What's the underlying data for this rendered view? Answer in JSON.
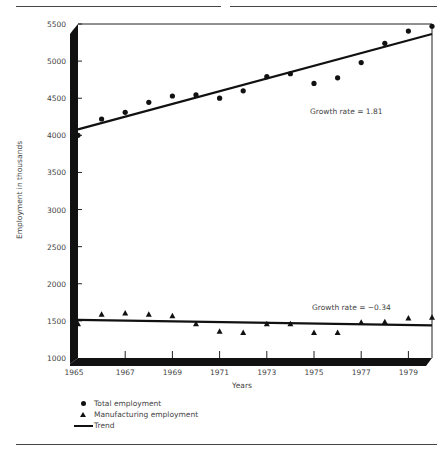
{
  "chart_data": {
    "type": "scatter",
    "title": "",
    "xlabel": "Years",
    "ylabel": "Employment in thousands",
    "ylim": [
      1000,
      5500
    ],
    "xlim": [
      1965,
      1980
    ],
    "grid": false,
    "legend_position": "below-left",
    "x_ticks": [
      "1965",
      "1967",
      "1969",
      "1971",
      "1973",
      "1975",
      "1977",
      "1979"
    ],
    "y_ticks": [
      "1000",
      "1500",
      "2000",
      "2500",
      "3000",
      "3500",
      "4000",
      "4500",
      "5000",
      "5500"
    ],
    "x": [
      1965,
      1966,
      1967,
      1968,
      1969,
      1970,
      1971,
      1972,
      1973,
      1974,
      1975,
      1976,
      1977,
      1978,
      1979,
      1980
    ],
    "series": [
      {
        "name": "Total employment",
        "marker": "circle",
        "values": [
          4000,
          4220,
          4310,
          4445,
          4530,
          4545,
          4500,
          4600,
          4790,
          4830,
          4700,
          4775,
          4980,
          5240,
          5405,
          5470
        ]
      },
      {
        "name": "Manufacturing employment",
        "marker": "triangle",
        "values": [
          1460,
          1590,
          1605,
          1590,
          1570,
          1460,
          1360,
          1345,
          1460,
          1460,
          1345,
          1345,
          1480,
          1490,
          1540,
          1550
        ]
      }
    ],
    "trends": [
      {
        "name": "Trend",
        "series": "Total employment",
        "start": [
          1965,
          4080
        ],
        "end": [
          1980,
          5365
        ],
        "annotation": "Growth rate = 1.81"
      },
      {
        "name": "Trend",
        "series": "Manufacturing employment",
        "start": [
          1965,
          1515
        ],
        "end": [
          1980,
          1440
        ],
        "annotation": "Growth rate = −0.34"
      }
    ],
    "legend": [
      "Total employment",
      "Manufacturing employment",
      "Trend"
    ]
  },
  "labels": {
    "ylabel": "Employment in thousands",
    "xlabel": "Years",
    "annot_total": "Growth rate = 1.81",
    "annot_mfg": "Growth rate = −0.34",
    "legend_total": "Total employment",
    "legend_mfg": "Manufacturing employment",
    "legend_trend": "Trend"
  }
}
